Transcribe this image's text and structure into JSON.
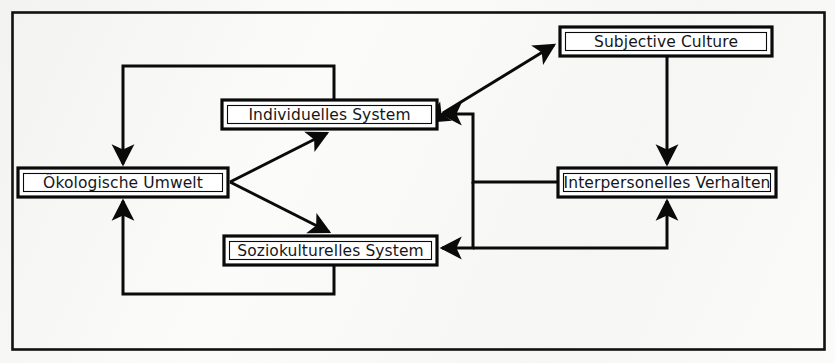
{
  "diagram": {
    "kind": "block-flow-diagram",
    "title_visible": false,
    "frame": {
      "label": "outer-frame",
      "color": "#111111"
    },
    "background_color": "#fbfbfa",
    "line_color": "#0a0a0a",
    "box_fill": "#ffffff",
    "nodes": [
      {
        "id": "subjective_culture",
        "label": "Subjective Culture",
        "x": 560,
        "y": 27,
        "w": 212,
        "h": 29
      },
      {
        "id": "individuelles_system",
        "label": "Individuelles System",
        "x": 222,
        "y": 100,
        "w": 215,
        "h": 29
      },
      {
        "id": "interpersonelles",
        "label": "Interpersonelles Verhalten",
        "x": 558,
        "y": 168,
        "w": 218,
        "h": 29
      },
      {
        "id": "oekologische_umwelt",
        "label": "Ökologische Umwelt",
        "x": 18,
        "y": 168,
        "w": 210,
        "h": 29
      },
      {
        "id": "soziokulturelles",
        "label": "Soziokulturelles System",
        "x": 224,
        "y": 236,
        "w": 213,
        "h": 29
      }
    ],
    "edges": [
      {
        "id": "e1",
        "from": "individuelles_system",
        "to": "oekologische_umwelt",
        "style": "orthogonal",
        "arrows": "single",
        "note": "top loop left then down into Oekologische Umwelt"
      },
      {
        "id": "e2",
        "from": "oekologische_umwelt",
        "to": "individuelles_system",
        "style": "diagonal",
        "arrows": "single"
      },
      {
        "id": "e3",
        "from": "oekologische_umwelt",
        "to": "soziokulturelles",
        "style": "diagonal",
        "arrows": "single"
      },
      {
        "id": "e4",
        "from": "soziokulturelles",
        "to": "oekologische_umwelt",
        "style": "orthogonal",
        "arrows": "single",
        "note": "bottom loop"
      },
      {
        "id": "e5",
        "from": "individuelles_system",
        "to": "subjective_culture",
        "style": "diagonal",
        "arrows": "double"
      },
      {
        "id": "e6",
        "from": "subjective_culture",
        "to": "interpersonelles",
        "style": "vertical",
        "arrows": "single"
      },
      {
        "id": "e7",
        "from": "interpersonelles",
        "to": "individuelles_system",
        "style": "orthogonal",
        "arrows": "single"
      },
      {
        "id": "e8",
        "from": "interpersonelles",
        "to": "soziokulturelles",
        "style": "orthogonal",
        "arrows": "single"
      },
      {
        "id": "e9",
        "from": "soziokulturelles",
        "to": "interpersonelles",
        "style": "orthogonal",
        "arrows": "single"
      }
    ]
  }
}
